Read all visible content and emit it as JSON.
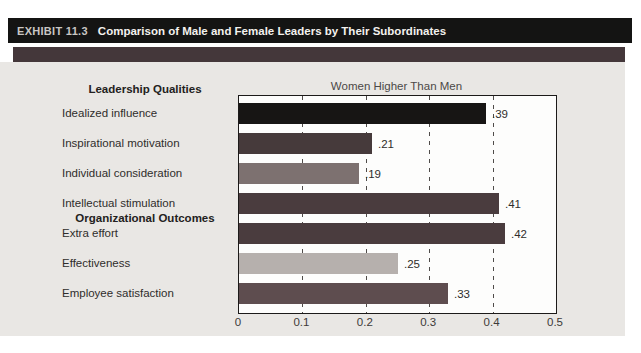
{
  "exhibit": {
    "label": "EXHIBIT 11.3",
    "title": "Comparison of Male and Female Leaders by Their Subordinates"
  },
  "chart_data": {
    "type": "bar",
    "orientation": "horizontal",
    "title": "Women Higher Than Men",
    "xlim": [
      0,
      0.5
    ],
    "x_ticks": [
      "0",
      "0.1",
      "0.2",
      "0.3",
      "0.4",
      "0.5"
    ],
    "x_tick_values": [
      0,
      0.1,
      0.2,
      0.3,
      0.4,
      0.5
    ],
    "grid": "dashed-vertical",
    "legend": "none",
    "groups": [
      {
        "header": "Leadership Qualities",
        "items": [
          {
            "label": "Idealized influence",
            "value": 0.39,
            "value_label": ".39",
            "color": "#171514"
          },
          {
            "label": "Inspirational motivation",
            "value": 0.21,
            "value_label": ".21",
            "color": "#463a3b"
          },
          {
            "label": "Individual consideration",
            "value": 0.19,
            "value_label": ".19",
            "color": "#7d7170"
          },
          {
            "label": "Intellectual stimulation",
            "value": 0.41,
            "value_label": ".41",
            "color": "#4a3c3e"
          }
        ]
      },
      {
        "header": "Organizational Outcomes",
        "items": [
          {
            "label": "Extra effort",
            "value": 0.42,
            "value_label": ".42",
            "color": "#4a3c3e"
          },
          {
            "label": "Effectiveness",
            "value": 0.25,
            "value_label": ".25",
            "color": "#b6b0ad"
          },
          {
            "label": "Employee satisfaction",
            "value": 0.33,
            "value_label": ".33",
            "color": "#5e4d4f"
          }
        ]
      }
    ]
  },
  "colors": {
    "header_bar": "#141413",
    "accent_band": "#44373a",
    "panel_background": "#e9e7e4",
    "plot_background": "#fdfdfc",
    "plot_border": "#1c1a19",
    "gridline": "#4f4b49"
  }
}
